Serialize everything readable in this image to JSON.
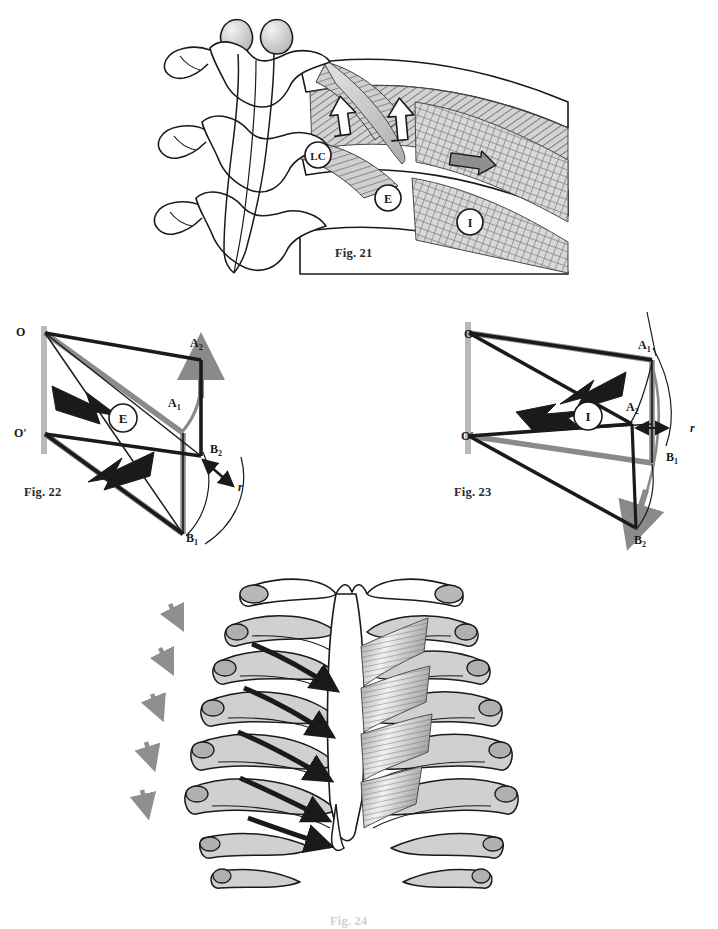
{
  "page": {
    "width": 718,
    "height": 924,
    "background": "#ffffff",
    "kind": "anatomy-biomechanics-figure-plate"
  },
  "colors": {
    "ink": "#1a1a1a",
    "caption": "#2b2b2b",
    "bone_fill": "#ffffff",
    "bone_shade": "#c9c9c9",
    "bone_shade_dark": "#a8a8a8",
    "muscle_hatch": "#8d8d8d",
    "muscle_fill": "#b5b5b5",
    "gray_vector": "#8a8a8a",
    "gray_bar": "#b9b9b9",
    "black_vector": "#1a1a1a",
    "arrow_gray": "#8f8f8f"
  },
  "figures": [
    {
      "id": "fig21",
      "caption": "Fig. 21",
      "description": "Cervical vertebrae with first ribs, scalene / levator costae / external and internal intercostal muscles shown with hatching",
      "labels": [
        {
          "key": "LC",
          "text": "LC",
          "meaning": "levator-costae",
          "x": 318,
          "y": 155
        },
        {
          "key": "E",
          "text": "E",
          "meaning": "external-intercostal",
          "x": 388,
          "y": 198
        },
        {
          "key": "I",
          "text": "I",
          "meaning": "internal-intercostal",
          "x": 470,
          "y": 222
        }
      ]
    },
    {
      "id": "fig22",
      "caption": "Fig. 22",
      "description": "Vector parallelogram diagram of expiration — rib rotation about axis OO'",
      "center_label": "E",
      "labels": [
        {
          "key": "O",
          "text": "O",
          "x": 19,
          "y": 333
        },
        {
          "key": "Op",
          "text": "O'",
          "x": 17,
          "y": 434
        },
        {
          "key": "A2",
          "text": "A",
          "sub": "2",
          "x": 194,
          "y": 339
        },
        {
          "key": "A1",
          "text": "A",
          "sub": "1",
          "x": 172,
          "y": 400
        },
        {
          "key": "B2",
          "text": "B",
          "sub": "2",
          "x": 218,
          "y": 444
        },
        {
          "key": "B1",
          "text": "B",
          "sub": "1",
          "x": 190,
          "y": 533
        },
        {
          "key": "r",
          "text": "r",
          "x": 242,
          "y": 483
        }
      ]
    },
    {
      "id": "fig23",
      "caption": "Fig. 23",
      "description": "Vector parallelogram diagram of inspiration — rib rotation about axis OO'",
      "center_label": "I",
      "labels": [
        {
          "key": "O",
          "text": "O",
          "x": 466,
          "y": 335
        },
        {
          "key": "Op",
          "text": "O'",
          "x": 463,
          "y": 436
        },
        {
          "key": "A1",
          "text": "A",
          "sub": "1",
          "x": 640,
          "y": 344
        },
        {
          "key": "A2",
          "text": "A",
          "sub": "2",
          "x": 628,
          "y": 404
        },
        {
          "key": "B1",
          "text": "B",
          "sub": "1",
          "x": 670,
          "y": 452
        },
        {
          "key": "B2",
          "text": "B",
          "sub": "2",
          "x": 638,
          "y": 537
        },
        {
          "key": "r",
          "text": "r",
          "x": 694,
          "y": 427
        }
      ]
    },
    {
      "id": "fig24",
      "caption": "Fig. 24",
      "description": "Anterior view of the rib cage and sternum with external intercostal muscle sheet, black arrows showing rib elevation pull and gray dashed arrows showing downward descent"
    }
  ]
}
